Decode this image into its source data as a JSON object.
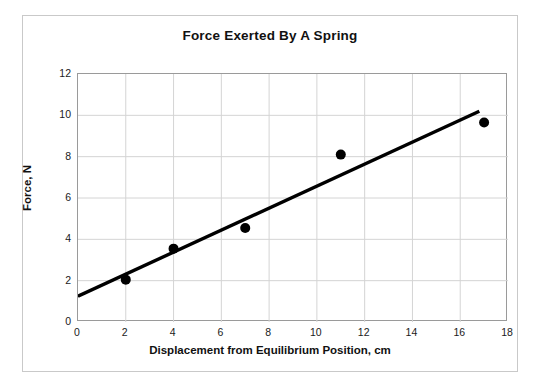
{
  "chart_data": {
    "type": "scatter",
    "title": "Force Exerted By A Spring",
    "xlabel": "Displacement from Equilibrium Position, cm",
    "ylabel": "Force, N",
    "xlim": [
      0,
      18
    ],
    "ylim": [
      0,
      12
    ],
    "xticks": [
      0,
      2,
      4,
      6,
      8,
      10,
      12,
      14,
      16,
      18
    ],
    "yticks": [
      0,
      2,
      4,
      6,
      8,
      10,
      12
    ],
    "grid": true,
    "legend": false,
    "legend_position": "none",
    "marker_color": "#000000",
    "marker_shape": "circle",
    "trendline_color": "#000000",
    "points": [
      {
        "x": 2,
        "y": 2.05
      },
      {
        "x": 4,
        "y": 3.55
      },
      {
        "x": 7,
        "y": 4.55
      },
      {
        "x": 11,
        "y": 8.1
      },
      {
        "x": 17,
        "y": 9.65
      }
    ],
    "series": [
      {
        "name": "Force vs Displacement",
        "x": [
          2,
          4,
          7,
          11,
          17
        ],
        "values": [
          2.05,
          3.55,
          4.55,
          8.1,
          9.65
        ]
      }
    ],
    "trendline": {
      "name": "best-fit line",
      "x_start": 0,
      "y_start": 1.25,
      "x_end": 16.8,
      "y_end": 10.2
    }
  },
  "style": {
    "grid_color": "#d4d4d4",
    "axis_color": "#9a9a9a",
    "frame_color": "#c9c9c9",
    "text_color": "#111111",
    "background": "#ffffff"
  }
}
